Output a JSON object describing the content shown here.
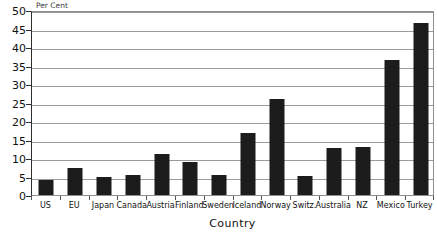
{
  "chart_data": {
    "type": "bar",
    "title": "",
    "xlabel": "Country",
    "ylabel": "Per Cent",
    "categories": [
      "US",
      "EU",
      "Japan",
      "Canada",
      "Austria",
      "Finland",
      "Sweden",
      "Iceland",
      "Norway",
      "Switz.",
      "Australia",
      "NZ",
      "Mexico",
      "Turkey"
    ],
    "values": [
      4.0,
      7.3,
      5.0,
      5.3,
      11.1,
      9.0,
      5.3,
      16.7,
      26.0,
      5.2,
      12.8,
      13.0,
      36.4,
      46.4
    ],
    "ylim": [
      0,
      50
    ],
    "ytick_step": 5,
    "yticks": [
      0,
      5,
      10,
      15,
      20,
      25,
      30,
      35,
      40,
      45,
      50
    ],
    "grid": true,
    "legend": false,
    "bar_color": "#1c1c1c",
    "gridline_color": "#9a9a9a",
    "axis_color": "#2e2e2e",
    "background_color": "#ffffff"
  }
}
